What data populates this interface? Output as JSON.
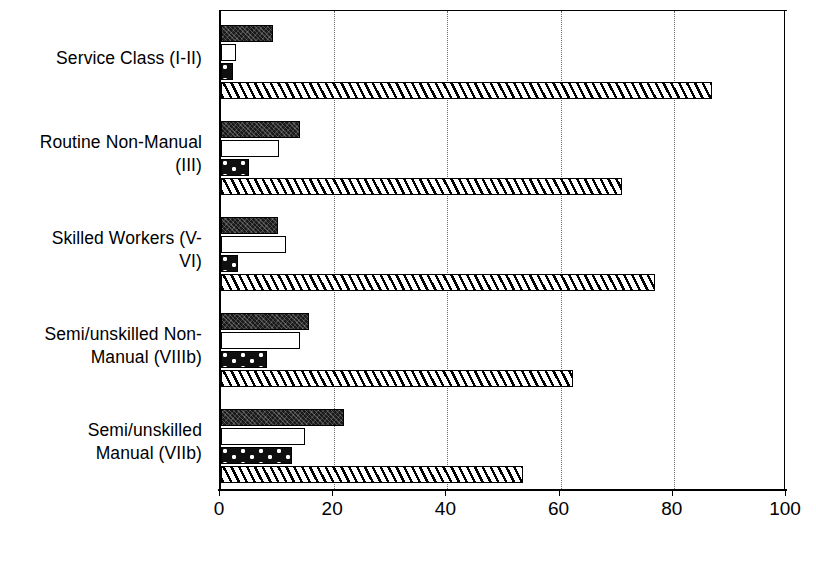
{
  "chart_data": {
    "type": "bar",
    "orientation": "horizontal",
    "title": "",
    "xlabel": "",
    "ylabel": "",
    "xlim": [
      0,
      100
    ],
    "xticks": [
      0,
      20,
      40,
      60,
      80,
      100
    ],
    "xtick_labels": [
      "0",
      "20",
      "40",
      "60",
      "80",
      "100"
    ],
    "grid": "vertical-dotted",
    "legend": "none",
    "categories": [
      "Service Class (I-II)",
      "Routine Non-Manual (III)",
      "Skilled Workers (V-VI)",
      "Semi/unskilled Non-Manual (VIIIb)",
      "Semi/unskilled Manual (VIIb)"
    ],
    "category_label_lines": [
      [
        "Service Class (I-II)"
      ],
      [
        "Routine Non-Manual",
        "(III)"
      ],
      [
        "Skilled Workers (V-",
        "VI)"
      ],
      [
        "Semi/unskilled Non-",
        "Manual (VIIIb)"
      ],
      [
        "Semi/unskilled",
        "Manual (VIIb)"
      ]
    ],
    "series": [
      {
        "name": "series-1",
        "fill": "dark",
        "values": [
          9.2,
          14.0,
          10.0,
          15.5,
          21.7
        ]
      },
      {
        "name": "series-2",
        "fill": "white",
        "values": [
          2.7,
          10.2,
          11.5,
          14.0,
          14.8
        ]
      },
      {
        "name": "series-3",
        "fill": "dotted",
        "values": [
          2.1,
          5.0,
          3.0,
          8.2,
          12.5
        ]
      },
      {
        "name": "series-4",
        "fill": "hatch",
        "values": [
          86.7,
          70.8,
          76.7,
          62.2,
          53.4
        ]
      }
    ]
  },
  "colors": {
    "axis": "#000000",
    "gridline": "#6b6b6b",
    "background": "#ffffff",
    "bar_dark": "#1a1a1a",
    "bar_white": "#ffffff",
    "bar_dotted": "#101010",
    "bar_hatch": "#ffffff"
  }
}
